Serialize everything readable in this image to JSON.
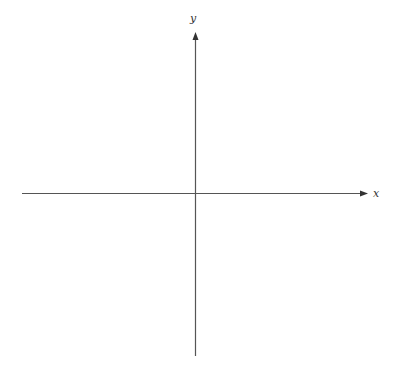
{
  "diagram": {
    "type": "cartesian-axes",
    "x_axis": {
      "label": "x",
      "color": "#555555"
    },
    "y_axis": {
      "label": "y",
      "color": "#555555"
    },
    "background": "#ffffff"
  }
}
